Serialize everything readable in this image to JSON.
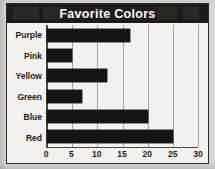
{
  "figure": {
    "title": "Favorite Colors",
    "title_bar_color": "#1c1b1a",
    "title_text_color": "#ffffff",
    "background_color": "#f2f1ee",
    "page_background_color": "#d8d6d2",
    "border_color": "#2b2a29",
    "bar_color": "#151413",
    "gridline_color": "#a5a29e",
    "axis_color": "#4a4846"
  },
  "chart_data": {
    "type": "bar",
    "orientation": "horizontal",
    "title": "Favorite Colors",
    "xlabel": "",
    "ylabel": "",
    "categories": [
      "Purple",
      "Pink",
      "Yellow",
      "Green",
      "Blue",
      "Red"
    ],
    "values": [
      16.5,
      5,
      12,
      7,
      20,
      25
    ],
    "xlim": [
      0,
      30
    ],
    "xticks": [
      0,
      5,
      10,
      15,
      20,
      25,
      30
    ],
    "xtick_labels": [
      "0",
      "5",
      "10",
      "15",
      "20",
      "25",
      "30"
    ],
    "grid": true,
    "grid_axis": "x",
    "legend": false,
    "series": [
      {
        "name": "Votes",
        "values": [
          16.5,
          5,
          12,
          7,
          20,
          25
        ]
      }
    ]
  }
}
